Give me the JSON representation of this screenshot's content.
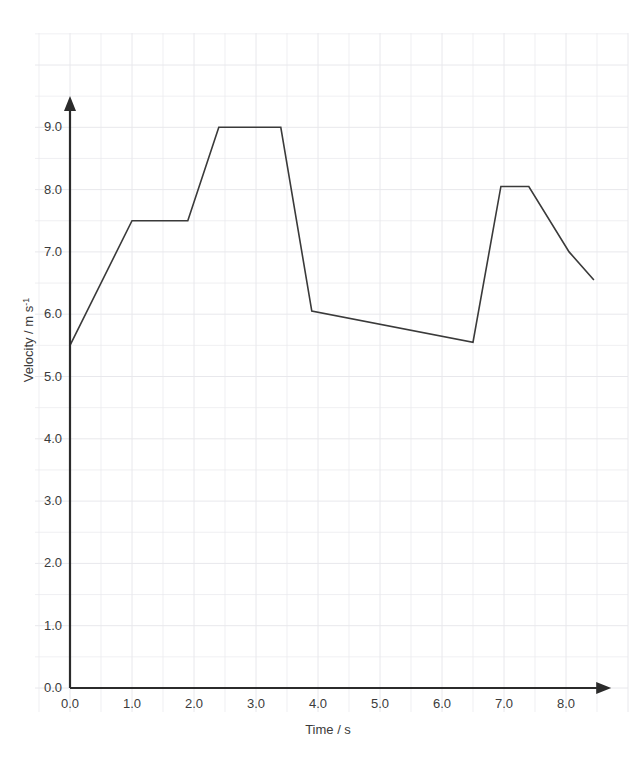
{
  "chart_data": {
    "type": "line",
    "title": "",
    "xlabel": "Time / s",
    "ylabel": "Velocity / m s",
    "ylabel_superscript": "-1",
    "xlim": [
      0.0,
      8.6
    ],
    "ylim": [
      0.0,
      9.6
    ],
    "grid": true,
    "grid_major_x": 0.5,
    "grid_major_y": 0.5,
    "legend": "none",
    "line_color": "#3a3a3a",
    "axis_color": "#2b2b2b",
    "grid_color": "#e8e8ec",
    "background": "#ffffff",
    "xticks": [
      "0.0",
      "1.0",
      "2.0",
      "3.0",
      "4.0",
      "5.0",
      "6.0",
      "7.0",
      "8.0"
    ],
    "xtick_values": [
      0.0,
      1.0,
      2.0,
      3.0,
      4.0,
      5.0,
      6.0,
      7.0,
      8.0
    ],
    "yticks": [
      "0.0",
      "1.0",
      "2.0",
      "3.0",
      "4.0",
      "5.0",
      "6.0",
      "7.0",
      "8.0",
      "9.0"
    ],
    "ytick_values": [
      0.0,
      1.0,
      2.0,
      3.0,
      4.0,
      5.0,
      6.0,
      7.0,
      8.0,
      9.0
    ],
    "series": [
      {
        "name": "velocity",
        "x": [
          0.0,
          1.0,
          1.9,
          2.4,
          3.4,
          3.9,
          6.5,
          6.95,
          7.4,
          8.05,
          8.45
        ],
        "y": [
          5.5,
          7.5,
          7.5,
          9.0,
          9.0,
          6.05,
          5.55,
          8.05,
          8.05,
          7.0,
          6.55
        ]
      }
    ],
    "annotations": []
  }
}
